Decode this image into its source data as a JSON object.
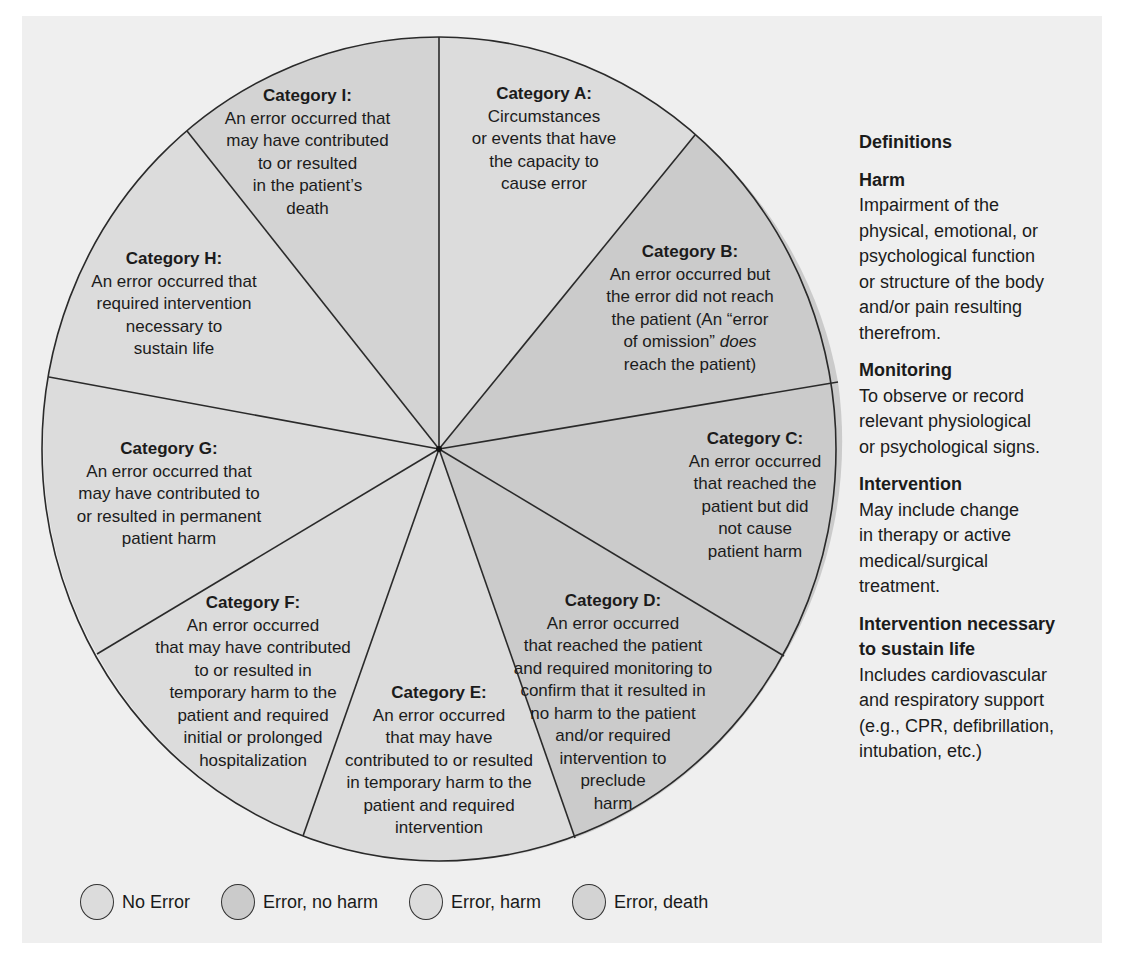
{
  "colors": {
    "panel_bg": "#efefef",
    "no_error": "#dcdcdc",
    "error_no_harm": "#cbcbcb",
    "error_harm": "#dcdcdc",
    "error_death": "#d3d3d3",
    "outline": "#2a2a2a"
  },
  "categories": [
    {
      "id": "A",
      "title": "Category A:",
      "desc": "Circumstances\nor events that have\nthe capacity to\ncause error",
      "group": "No Error"
    },
    {
      "id": "B",
      "title": "Category B:",
      "desc_parts": [
        "An error occurred but\nthe error did not reach\nthe patient (An “error\nof omission” ",
        "does",
        "\nreach the patient)"
      ],
      "group": "Error, no harm"
    },
    {
      "id": "C",
      "title": "Category C:",
      "desc": "An error occurred\nthat reached the\npatient but did\nnot cause\npatient harm",
      "group": "Error, no harm"
    },
    {
      "id": "D",
      "title": "Category D:",
      "desc": "An error occurred\nthat reached the patient\nand required monitoring to\nconfirm that it resulted in\nno harm to the patient\nand/or required\nintervention to\npreclude\nharm",
      "group": "Error, no harm"
    },
    {
      "id": "E",
      "title": "Category E:",
      "desc": "An error occurred\nthat may have\ncontributed to or resulted\nin temporary harm to the\npatient and required\nintervention",
      "group": "Error, harm"
    },
    {
      "id": "F",
      "title": "Category F:",
      "desc": "An error occurred\nthat may have contributed\nto or resulted in\ntemporary harm to the\npatient and required\ninitial or prolonged\nhospitalization",
      "group": "Error, harm"
    },
    {
      "id": "G",
      "title": "Category G:",
      "desc": "An error occurred that\nmay have contributed to\nor resulted in permanent\npatient harm",
      "group": "Error, harm"
    },
    {
      "id": "H",
      "title": "Category H:",
      "desc": "An error occurred that\nrequired intervention\nnecessary to\nsustain life",
      "group": "Error, harm"
    },
    {
      "id": "I",
      "title": "Category I:",
      "desc": "An error occurred that\nmay have contributed\nto or resulted\nin the patient’s\ndeath",
      "group": "Error, death"
    }
  ],
  "definitions": {
    "heading": "Definitions",
    "entries": [
      {
        "term": "Harm",
        "desc": "Impairment of the\nphysical, emotional, or\npsychological function\nor structure of the body\nand/or pain resulting\ntherefrom."
      },
      {
        "term": "Monitoring",
        "desc": "To observe or record\nrelevant physiological\nor psychological signs."
      },
      {
        "term": "Intervention",
        "desc": "May include change\nin therapy or active\nmedical/surgical\ntreatment."
      },
      {
        "term": "Intervention necessary\nto sustain life",
        "desc": "Includes cardiovascular\nand respiratory support\n(e.g., CPR, defibrillation,\nintubation, etc.)"
      }
    ]
  },
  "legend": [
    {
      "label": "No Error",
      "color": "#dcdcdc"
    },
    {
      "label": "Error, no harm",
      "color": "#cbcbcb"
    },
    {
      "label": "Error, harm",
      "color": "#dcdcdc"
    },
    {
      "label": "Error, death",
      "color": "#d3d3d3"
    }
  ]
}
